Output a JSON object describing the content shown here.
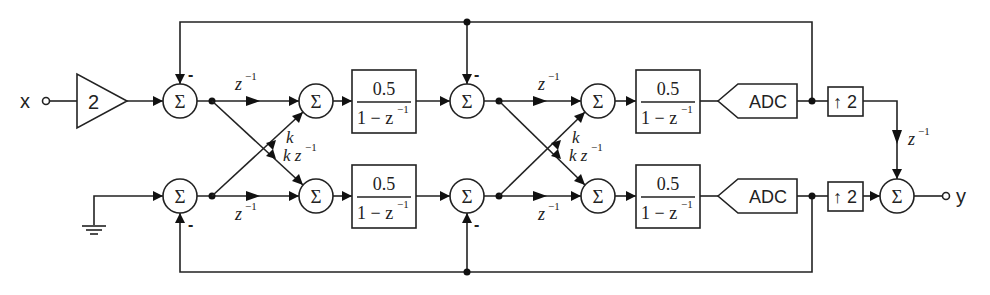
{
  "diagram": {
    "input_label": "x",
    "output_label": "y",
    "gain": "2",
    "sum_symbol": "Σ",
    "minus_sign": "-",
    "delay": "z",
    "delay_exp": "−1",
    "cross_gain_k": "k",
    "cross_gain_kz": "k z",
    "filter": {
      "numerator": "0.5",
      "denominator_prefix": "1 − z",
      "denominator_exp": "−1"
    },
    "adc_label": "ADC",
    "upsampler_label": "↑ 2",
    "ground": "ground"
  }
}
